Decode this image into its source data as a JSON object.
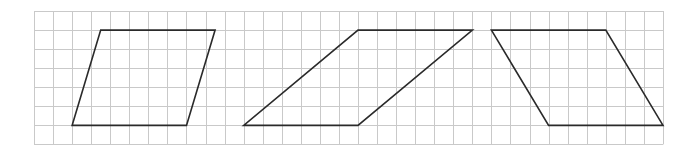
{
  "grid": {
    "origin_x": 34,
    "origin_y": 11,
    "cell": 19.06,
    "cols": 33,
    "rows": 7,
    "line_color": "#c9c9c9",
    "line_width": 1
  },
  "shapes": [
    {
      "name": "parallelogram-left",
      "type": "parallelogram",
      "vertices_grid": [
        [
          3.5,
          1
        ],
        [
          9.5,
          1
        ],
        [
          8,
          6
        ],
        [
          2,
          6
        ]
      ]
    },
    {
      "name": "parallelogram-middle",
      "type": "parallelogram",
      "vertices_grid": [
        [
          17,
          1
        ],
        [
          23,
          1
        ],
        [
          17,
          6
        ],
        [
          11,
          6
        ]
      ]
    },
    {
      "name": "parallelogram-right",
      "type": "parallelogram",
      "vertices_grid": [
        [
          24,
          1
        ],
        [
          30,
          1
        ],
        [
          33,
          6
        ],
        [
          27,
          6
        ]
      ]
    }
  ],
  "stroke_color": "#2a2a2a",
  "stroke_width": 1.6
}
